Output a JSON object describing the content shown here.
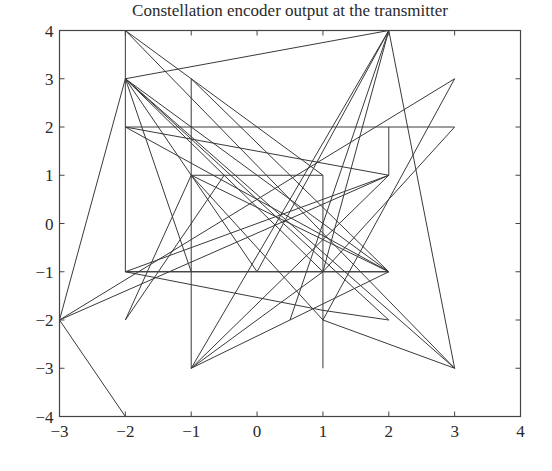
{
  "chart_data": {
    "type": "line",
    "title": "Constellation encoder output at the transmitter",
    "xlabel": "",
    "ylabel": "",
    "xlim": [
      -3,
      4
    ],
    "ylim": [
      -4,
      4
    ],
    "xticks": [
      "-3",
      "-2",
      "-1",
      "0",
      "1",
      "2",
      "3",
      "4"
    ],
    "yticks": [
      "-4",
      "-3",
      "-2",
      "-1",
      "0",
      "1",
      "2",
      "3",
      "4"
    ],
    "grid": false,
    "legend": null,
    "line_color": "#3a3a3a",
    "constellation_points": [
      [
        -2,
        4
      ],
      [
        -2,
        3
      ],
      [
        -2,
        2
      ],
      [
        -2,
        -1
      ],
      [
        -2,
        -2
      ],
      [
        -3,
        -2
      ],
      [
        -2,
        -4
      ],
      [
        -1,
        3
      ],
      [
        -1,
        1
      ],
      [
        -1,
        -1
      ],
      [
        -1,
        -3
      ],
      [
        1,
        1
      ],
      [
        1,
        -1
      ],
      [
        1,
        -2
      ],
      [
        1,
        -3
      ],
      [
        2,
        4
      ],
      [
        2,
        2
      ],
      [
        2,
        1
      ],
      [
        2,
        -1
      ],
      [
        2,
        -2
      ],
      [
        3,
        3
      ],
      [
        3,
        2
      ],
      [
        3,
        -3
      ]
    ],
    "segments": [
      [
        [
          -2,
          4
        ],
        [
          -2,
          -1
        ]
      ],
      [
        [
          -2,
          4
        ],
        [
          1,
          1
        ]
      ],
      [
        [
          -2,
          3
        ],
        [
          2,
          4
        ]
      ],
      [
        [
          2,
          4
        ],
        [
          3,
          -3
        ]
      ],
      [
        [
          2,
          4
        ],
        [
          1,
          -1
        ]
      ],
      [
        [
          2,
          4
        ],
        [
          -1,
          -3
        ]
      ],
      [
        [
          -2,
          2
        ],
        [
          3,
          2
        ]
      ],
      [
        [
          -2,
          2
        ],
        [
          2,
          1
        ]
      ],
      [
        [
          -2,
          2
        ],
        [
          2,
          -1
        ]
      ],
      [
        [
          -1,
          1
        ],
        [
          1,
          1
        ]
      ],
      [
        [
          -2,
          -1
        ],
        [
          2,
          -1
        ]
      ],
      [
        [
          -1,
          3
        ],
        [
          -1,
          -3
        ]
      ],
      [
        [
          1,
          1
        ],
        [
          1,
          -3
        ]
      ],
      [
        [
          2,
          2
        ],
        [
          2,
          1
        ]
      ],
      [
        [
          -3,
          -2
        ],
        [
          -2,
          3
        ]
      ],
      [
        [
          -3,
          -2
        ],
        [
          -2,
          -4
        ]
      ],
      [
        [
          -3,
          -2
        ],
        [
          3,
          3
        ]
      ],
      [
        [
          -3,
          -2
        ],
        [
          2,
          1
        ]
      ],
      [
        [
          -2,
          3
        ],
        [
          2,
          -1
        ]
      ],
      [
        [
          -2,
          3
        ],
        [
          2,
          -2
        ]
      ],
      [
        [
          -2,
          3
        ],
        [
          1,
          -1
        ]
      ],
      [
        [
          -2,
          3
        ],
        [
          -1,
          -1
        ]
      ],
      [
        [
          -2,
          3
        ],
        [
          0,
          -1
        ]
      ],
      [
        [
          -2,
          3
        ],
        [
          3,
          -3
        ]
      ],
      [
        [
          -1,
          3
        ],
        [
          2,
          -1
        ]
      ],
      [
        [
          -1,
          1
        ],
        [
          1,
          -2
        ]
      ],
      [
        [
          -1,
          1
        ],
        [
          2,
          -1
        ]
      ],
      [
        [
          -1,
          1
        ],
        [
          -2,
          -2
        ]
      ],
      [
        [
          -2,
          -2
        ],
        [
          -0.5,
          1
        ]
      ],
      [
        [
          -0.5,
          1
        ],
        [
          -0.5,
          1
        ]
      ],
      [
        [
          -1,
          -3
        ],
        [
          2,
          -1
        ]
      ],
      [
        [
          -1,
          -3
        ],
        [
          2,
          1
        ]
      ],
      [
        [
          -1,
          -3
        ],
        [
          1,
          -1
        ]
      ],
      [
        [
          1,
          -1
        ],
        [
          3,
          2
        ]
      ],
      [
        [
          1,
          -2
        ],
        [
          3,
          3
        ]
      ],
      [
        [
          1,
          -2
        ],
        [
          3,
          -3
        ]
      ],
      [
        [
          1,
          -1
        ],
        [
          2,
          -1
        ]
      ],
      [
        [
          1,
          -1
        ],
        [
          -2,
          -1
        ]
      ],
      [
        [
          0,
          -1
        ],
        [
          2,
          4
        ]
      ],
      [
        [
          -2,
          -1
        ],
        [
          2,
          1
        ]
      ],
      [
        [
          -2,
          -1
        ],
        [
          1,
          -1.8
        ]
      ],
      [
        [
          1,
          -1.8
        ],
        [
          2,
          -2
        ]
      ],
      [
        [
          0.5,
          -2
        ],
        [
          2,
          4
        ]
      ],
      [
        [
          -2,
          4
        ],
        [
          3,
          -3
        ]
      ]
    ]
  }
}
